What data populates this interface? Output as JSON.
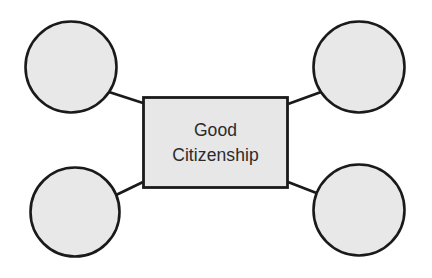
{
  "diagram": {
    "type": "hub-and-spoke-concept-map",
    "canvas": {
      "width": 432,
      "height": 278,
      "background": "#ffffff"
    },
    "colors": {
      "node_fill": "#e8e8e8",
      "center_fill": "#e7e7e7",
      "stroke": "#1a1a1a",
      "text": "#2b2b2b"
    },
    "center": {
      "shape": "rectangle",
      "label_line_1": "Good",
      "label_line_2": "Citizenship",
      "x": 142,
      "y": 96,
      "width": 147,
      "height": 93
    },
    "nodes": [
      {
        "id": "top-left",
        "label": "",
        "shape": "circle",
        "cx": 71,
        "cy": 67,
        "r": 46
      },
      {
        "id": "top-right",
        "label": "",
        "shape": "circle",
        "cx": 359,
        "cy": 67,
        "r": 46
      },
      {
        "id": "bottom-left",
        "label": "",
        "shape": "circle",
        "cx": 75,
        "cy": 212,
        "r": 45
      },
      {
        "id": "bottom-right",
        "label": "",
        "shape": "circle",
        "cx": 359,
        "cy": 210,
        "r": 46
      }
    ],
    "connectors": [
      {
        "id": "connector-top-left",
        "from": "top-left",
        "to": "center",
        "x1": 109,
        "y1": 92,
        "x2": 142,
        "y2": 103
      },
      {
        "id": "connector-top-right",
        "from": "center",
        "to": "top-right",
        "x1": 289,
        "y1": 104,
        "x2": 321,
        "y2": 92
      },
      {
        "id": "connector-bottom-left",
        "from": "bottom-left",
        "to": "center",
        "x1": 114,
        "y1": 196,
        "x2": 142,
        "y2": 182
      },
      {
        "id": "connector-bottom-right",
        "from": "center",
        "to": "bottom-right",
        "x1": 289,
        "y1": 182,
        "x2": 319,
        "y2": 194
      }
    ]
  }
}
